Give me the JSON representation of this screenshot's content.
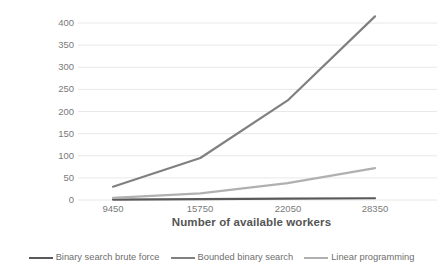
{
  "chart_data": {
    "type": "line",
    "title": "",
    "xlabel": "Number of available workers",
    "ylabel": "Execution time (s)",
    "categories": [
      "9450",
      "15750",
      "22050",
      "28350"
    ],
    "x": [
      9450,
      15750,
      22050,
      28350
    ],
    "xlim": [
      9450,
      28350
    ],
    "ylim": [
      0,
      425
    ],
    "yticks": [
      "0",
      "50",
      "100",
      "150",
      "200",
      "250",
      "300",
      "350",
      "400"
    ],
    "ytick_values": [
      0,
      50,
      100,
      150,
      200,
      250,
      300,
      350,
      400
    ],
    "grid": "horizontal",
    "legend_position": "bottom",
    "series": [
      {
        "name": "Binary search brute force",
        "color": "#595959",
        "values": [
          1,
          2,
          3,
          4
        ]
      },
      {
        "name": "Bounded binary search",
        "color": "#808080",
        "values": [
          30,
          95,
          225,
          415
        ]
      },
      {
        "name": "Linear programming",
        "color": "#b0b0b0",
        "values": [
          5,
          15,
          38,
          72
        ]
      }
    ]
  },
  "axes": {
    "y_title": "Execution time (s)",
    "x_title": "Number of available workers",
    "y_ticks": [
      "400",
      "350",
      "300",
      "250",
      "200",
      "150",
      "100",
      "50",
      "0"
    ],
    "x_ticks": [
      "9450",
      "15750",
      "22050",
      "28350"
    ]
  },
  "legend": {
    "items": [
      {
        "label": "Binary search brute force",
        "color": "#595959"
      },
      {
        "label": "Bounded binary search",
        "color": "#808080"
      },
      {
        "label": "Linear programming",
        "color": "#b0b0b0"
      }
    ]
  },
  "colors": {
    "grid": "#e8e8e8",
    "text": "#7a7a7a",
    "title_text": "#555555",
    "background": "#ffffff"
  }
}
